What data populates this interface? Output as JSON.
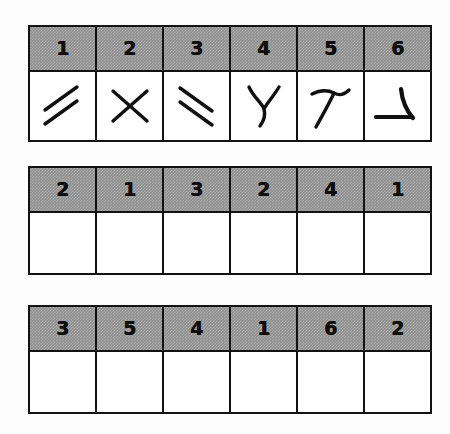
{
  "page": {
    "background_color": "#fdfdfd",
    "header_fill_color": "#919191",
    "border_color": "#121212",
    "ink_color": "#101010"
  },
  "tables": [
    {
      "name": "symbol-key-table",
      "header": [
        "1",
        "2",
        "3",
        "4",
        "5",
        "6"
      ],
      "body_kind": "symbols",
      "cells": [
        {
          "symbol": "double-slash-up-right-icon"
        },
        {
          "symbol": "x-cross-icon"
        },
        {
          "symbol": "double-slash-down-right-icon"
        },
        {
          "symbol": "y-upright-icon"
        },
        {
          "symbol": "y-rotated-up-right-icon"
        },
        {
          "symbol": "y-rotated-left-icon"
        }
      ]
    },
    {
      "name": "answer-table-1",
      "header": [
        "2",
        "1",
        "3",
        "2",
        "4",
        "1"
      ],
      "body_kind": "blank",
      "cells": [
        {
          "value": ""
        },
        {
          "value": ""
        },
        {
          "value": ""
        },
        {
          "value": ""
        },
        {
          "value": ""
        },
        {
          "value": ""
        }
      ]
    },
    {
      "name": "answer-table-2",
      "header": [
        "3",
        "5",
        "4",
        "1",
        "6",
        "2"
      ],
      "body_kind": "blank",
      "cells": [
        {
          "value": ""
        },
        {
          "value": ""
        },
        {
          "value": ""
        },
        {
          "value": ""
        },
        {
          "value": ""
        },
        {
          "value": ""
        }
      ]
    }
  ]
}
